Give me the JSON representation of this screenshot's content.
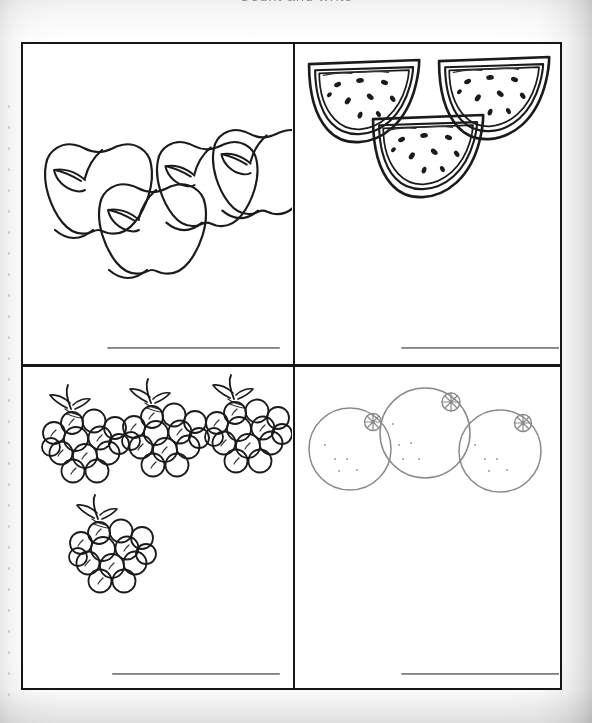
{
  "worksheet": {
    "header_text": "Count and write",
    "background_color": "#ffffff",
    "ink_color": "#1b1b1b",
    "line_color": "#6f6f6f"
  },
  "cells": [
    {
      "id": "apples",
      "position": "top-left",
      "fruit_name": "apple",
      "count": 4,
      "answer_value": "",
      "answer_placeholder": "",
      "items": [
        {
          "cx": 68,
          "cy": 118,
          "scale": 1.0,
          "leaf": "left",
          "stem": "up-right"
        },
        {
          "cx": 122,
          "cy": 158,
          "scale": 1.0,
          "leaf": "left",
          "stem": "up-right"
        },
        {
          "cx": 182,
          "cy": 120,
          "scale": 0.94,
          "leaf": "left",
          "stem": "up-right"
        },
        {
          "cx": 236,
          "cy": 109,
          "scale": 0.94,
          "leaf": "left",
          "stem": "up-right"
        }
      ]
    },
    {
      "id": "watermelons",
      "position": "top-right",
      "fruit_name": "watermelon slice",
      "count": 3,
      "answer_value": "",
      "answer_placeholder": "",
      "items": [
        {
          "cx": 62,
          "cy": 60,
          "scale": 1.0
        },
        {
          "cx": 192,
          "cy": 57,
          "scale": 1.0
        },
        {
          "cx": 128,
          "cy": 113,
          "scale": 1.0
        }
      ]
    },
    {
      "id": "grapes",
      "position": "bottom-left",
      "fruit_name": "bunch of grapes",
      "count": 4,
      "answer_value": "",
      "answer_placeholder": "",
      "items": [
        {
          "cx": 55,
          "cy": 70,
          "scale": 1.0,
          "berries": 13
        },
        {
          "cx": 135,
          "cy": 64,
          "scale": 1.0,
          "berries": 13
        },
        {
          "cx": 218,
          "cy": 60,
          "scale": 1.0,
          "berries": 13
        },
        {
          "cx": 82,
          "cy": 180,
          "scale": 1.0,
          "berries": 13
        }
      ]
    },
    {
      "id": "oranges",
      "position": "bottom-right",
      "fruit_name": "orange",
      "count": 3,
      "answer_value": "",
      "answer_placeholder": "",
      "items": [
        {
          "cx": 55,
          "cy": 82,
          "r": 41,
          "navel": "upper-right"
        },
        {
          "cx": 130,
          "cy": 66,
          "r": 45,
          "navel": "upper-right"
        },
        {
          "cx": 205,
          "cy": 84,
          "r": 41,
          "navel": "upper-right"
        }
      ]
    }
  ]
}
